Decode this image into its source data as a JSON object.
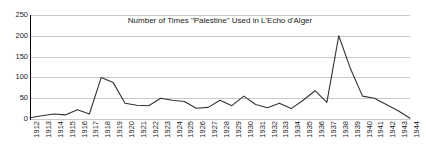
{
  "chart_data": {
    "type": "line",
    "title": "Number of Times \"Palestine\" Used in L'Echo d'Alger",
    "xlabel": "",
    "ylabel": "",
    "ylim": [
      0,
      250
    ],
    "yticks": [
      0,
      50,
      100,
      150,
      200,
      250
    ],
    "grid": true,
    "legend": false,
    "legend_position": "none",
    "line_color": "#333333",
    "grid_color": "#c9c9c9",
    "categories": [
      "1912",
      "1913",
      "1914",
      "1915",
      "1916",
      "1917",
      "1918",
      "1919",
      "1920",
      "1921",
      "1922",
      "1923",
      "1924",
      "1925",
      "1926",
      "1927",
      "1928",
      "1929",
      "1930",
      "1931",
      "1932",
      "1933",
      "1934",
      "1935",
      "1936",
      "1937",
      "1938",
      "1939",
      "1940",
      "1941",
      "1942",
      "1943",
      "1944"
    ],
    "values": [
      3,
      8,
      12,
      10,
      22,
      12,
      100,
      88,
      38,
      33,
      32,
      50,
      45,
      42,
      26,
      28,
      45,
      32,
      55,
      35,
      27,
      38,
      25,
      45,
      68,
      40,
      200,
      120,
      55,
      50,
      35,
      20,
      2
    ]
  },
  "yaxis": {
    "tick_labels": [
      "250",
      "200",
      "150",
      "100",
      "50",
      "0"
    ]
  }
}
